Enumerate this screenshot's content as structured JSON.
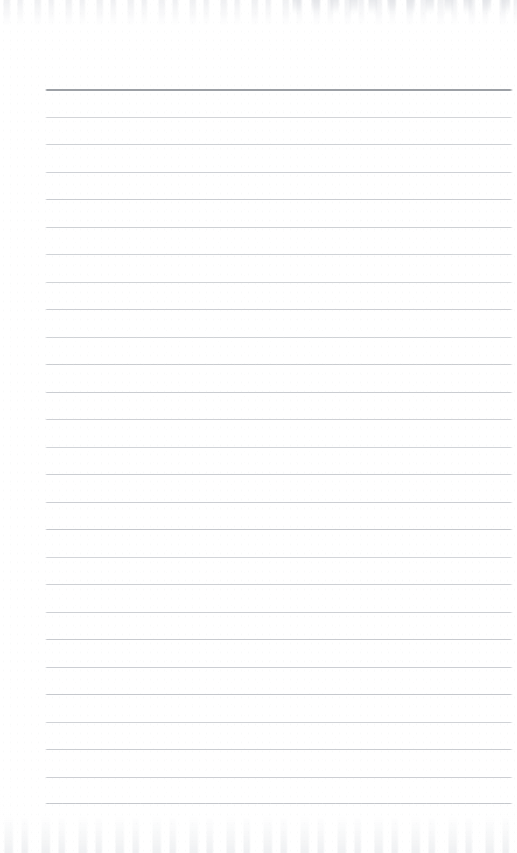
{
  "document": {
    "kind": "scanned-lined-notepad-page",
    "title": "Lined Notepad Page",
    "text_content": "",
    "visible_text": [],
    "page_width": 517,
    "page_height": 853,
    "background_color": "#ffffff"
  },
  "paper": {
    "margin_left_px": 45,
    "margin_right_px": 513,
    "line_color": "#c9ccd0",
    "header_line_color": "#9da1a6",
    "paper_color": "#ffffff",
    "line_spacing_px": 27.5,
    "first_line_y_px": 89,
    "line_count": 27
  },
  "rules": [
    {
      "y": 89,
      "color": "#9da1a6",
      "weight": 2,
      "header": true
    },
    {
      "y": 116.5,
      "color": "#caccd0",
      "weight": 1,
      "header": false
    },
    {
      "y": 144,
      "color": "#c7cacf",
      "weight": 1,
      "header": false
    },
    {
      "y": 171.5,
      "color": "#c9ccd1",
      "weight": 1,
      "header": false
    },
    {
      "y": 199,
      "color": "#c5c8cd",
      "weight": 1,
      "header": false
    },
    {
      "y": 226.5,
      "color": "#cbced2",
      "weight": 1,
      "header": false
    },
    {
      "y": 254,
      "color": "#c6c9ce",
      "weight": 1,
      "header": false
    },
    {
      "y": 281.5,
      "color": "#c9ccd0",
      "weight": 1,
      "header": false
    },
    {
      "y": 309,
      "color": "#c4c7cc",
      "weight": 1,
      "header": false
    },
    {
      "y": 336.5,
      "color": "#cacdd1",
      "weight": 1,
      "header": false
    },
    {
      "y": 364,
      "color": "#c6c9cd",
      "weight": 1,
      "header": false
    },
    {
      "y": 391.5,
      "color": "#c8cbd0",
      "weight": 1,
      "header": false
    },
    {
      "y": 419,
      "color": "#c3c6cb",
      "weight": 1,
      "header": false
    },
    {
      "y": 446.5,
      "color": "#c9ccd1",
      "weight": 1,
      "header": false
    },
    {
      "y": 474,
      "color": "#c5c8cd",
      "weight": 1,
      "header": false
    },
    {
      "y": 501.5,
      "color": "#c7cacf",
      "weight": 1,
      "header": false
    },
    {
      "y": 529,
      "color": "#c2c5ca",
      "weight": 1,
      "header": false
    },
    {
      "y": 556.5,
      "color": "#c8cbd0",
      "weight": 1,
      "header": false
    },
    {
      "y": 584,
      "color": "#c4c7cc",
      "weight": 1,
      "header": false
    },
    {
      "y": 611.5,
      "color": "#c6c9ce",
      "weight": 1,
      "header": false
    },
    {
      "y": 639,
      "color": "#c1c4c9",
      "weight": 1,
      "header": false
    },
    {
      "y": 666.5,
      "color": "#c7cacf",
      "weight": 1,
      "header": false
    },
    {
      "y": 694,
      "color": "#c3c6cb",
      "weight": 1,
      "header": false
    },
    {
      "y": 721.5,
      "color": "#c5c8cd",
      "weight": 1,
      "header": false
    },
    {
      "y": 749,
      "color": "#c0c3c8",
      "weight": 1,
      "header": false
    },
    {
      "y": 776.5,
      "color": "#c4c7cc",
      "weight": 1,
      "header": false
    },
    {
      "y": 803,
      "color": "#bfc2c7",
      "weight": 1,
      "header": false
    }
  ],
  "artifacts": {
    "top_ghost_label": "scanner-bleed-through-top",
    "bottom_ghost_label": "scanner-bleed-through-bottom",
    "speckle_label": "paper-grain"
  }
}
